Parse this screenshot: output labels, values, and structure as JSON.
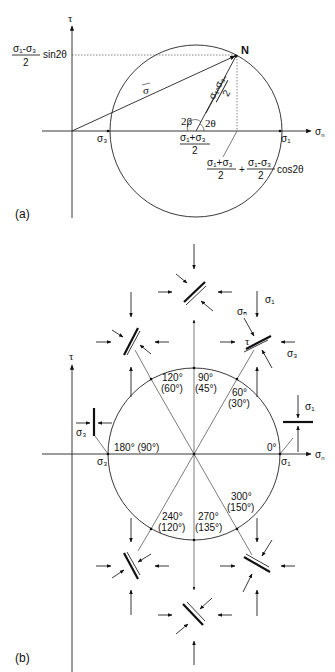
{
  "panel_a": {
    "label": "(a)",
    "axis_tau": "τ",
    "axis_sigma_n": "σ",
    "axis_sigma_n_sub": "n",
    "point_N": "N",
    "vector_sigma": "σ",
    "sin_term_num": "σ₁-σ₃",
    "sin_term_den": "2",
    "sin_term_tail": "sin2θ",
    "radius_num": "σ₁-σ₃",
    "radius_den": "2",
    "angle_2beta": "2β",
    "angle_2theta": "2θ",
    "sigma3": "σ₃",
    "sigma1": "σ₁",
    "center_num": "σ₁+σ₃",
    "center_den": "2",
    "cos_term_num1": "σ₁+σ₃",
    "cos_term_den1": "2",
    "cos_term_plus": "+",
    "cos_term_num2": "σ₁-σ₃",
    "cos_term_den2": "2",
    "cos_term_tail": "cos2θ"
  },
  "panel_b": {
    "label": "(b)",
    "axis_tau": "τ",
    "axis_sigma_n": "σ",
    "axis_sigma_n_sub": "n",
    "sigma3_axis": "σ₃",
    "sigma1_axis": "σ₁",
    "sigma1_label": "σ₁",
    "sigma3_label": "σ₃",
    "sigma1_right": "σ₁",
    "sigma3_left": "σ₃",
    "sigma_n_label": "σₙ",
    "tau_small": "τ",
    "angles": [
      {
        "a": "0°",
        "b": ""
      },
      {
        "a": "60°",
        "b": "(30°)"
      },
      {
        "a": "90°",
        "b": "(45°)"
      },
      {
        "a": "120°",
        "b": "(60°)"
      },
      {
        "a": "180° (90°)",
        "b": ""
      },
      {
        "a": "240°",
        "b": "(120°)"
      },
      {
        "a": "270°",
        "b": "(135°)"
      },
      {
        "a": "300°",
        "b": "(150°)"
      }
    ]
  }
}
